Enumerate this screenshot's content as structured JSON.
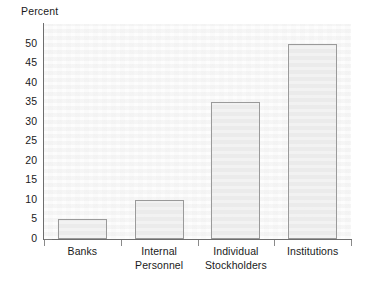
{
  "chart_data": {
    "type": "bar",
    "title": "",
    "ylabel": "Percent",
    "xlabel": "",
    "categories": [
      "Banks",
      "Internal Personnel",
      "Individual Stockholders",
      "Institutions"
    ],
    "category_lines": [
      [
        "Banks"
      ],
      [
        "Internal",
        "Personnel"
      ],
      [
        "Individual",
        "Stockholders"
      ],
      [
        "Institutions"
      ]
    ],
    "values": [
      5,
      10,
      35,
      50
    ],
    "ylim": [
      0,
      55
    ],
    "yticks": [
      0,
      5,
      10,
      15,
      20,
      25,
      30,
      35,
      40,
      45,
      50
    ],
    "ytick_labels": [
      "0",
      "5",
      "10",
      "15",
      "20",
      "25",
      "30",
      "35",
      "40",
      "45",
      "50"
    ],
    "grid": false,
    "legend": null,
    "annotations": []
  },
  "style": {
    "bar_fill": "#ebebeb",
    "bar_border": "#9a9a9a",
    "plot_background": "#f6f6f6",
    "axis_color": "#6e6e6e",
    "text_color": "#1a1a1a",
    "page_background": "#ffffff"
  }
}
